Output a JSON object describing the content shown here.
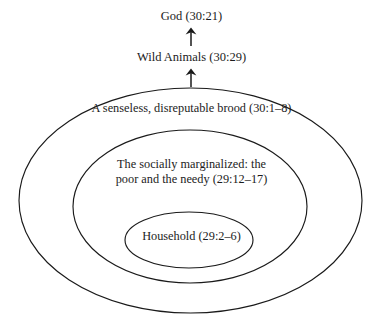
{
  "diagram": {
    "type": "concentric-ellipses-with-arrow-chain",
    "background_color": "#ffffff",
    "stroke_color": "#1a1a1a",
    "text_color": "#1c1c1c",
    "top_chain": [
      {
        "id": "god",
        "label": "God (30:21)"
      },
      {
        "id": "wild_animals",
        "label": "Wild Animals (30:29)"
      }
    ],
    "arrows": [
      {
        "id": "brood-to-wild",
        "glyph": "up-arrow",
        "direction": "up"
      },
      {
        "id": "wild-to-god",
        "glyph": "up-arrow",
        "direction": "up"
      }
    ],
    "rings": [
      {
        "id": "outer",
        "level": 1,
        "label": "A senseless, disreputable brood (30:1–8)"
      },
      {
        "id": "middle",
        "level": 2,
        "label_line_1": "The socially marginalized: the",
        "label_line_2": "poor and the needy (29:12–17)"
      },
      {
        "id": "inner",
        "level": 3,
        "label": "Household (29:2–6)"
      }
    ]
  }
}
